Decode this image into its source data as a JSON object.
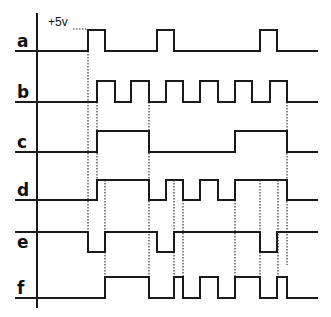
{
  "diagram": {
    "title": "",
    "voltage_label": "+5v",
    "axis": {
      "x": 37,
      "y_top": 13,
      "y_bottom": 308
    },
    "x_start": 15,
    "x_end": 318,
    "signals": [
      {
        "label": "a",
        "high_y": 30,
        "low_y": 51,
        "initial": "low",
        "edges": [
          88,
          105,
          157,
          174,
          260,
          277
        ]
      },
      {
        "label": "b",
        "high_y": 81,
        "low_y": 102,
        "initial": "low",
        "edges": [
          97,
          115,
          131,
          149,
          166,
          183,
          200,
          218,
          235,
          252,
          270,
          287
        ]
      },
      {
        "label": "c",
        "high_y": 131,
        "low_y": 152,
        "initial": "low",
        "edges": [
          97,
          149,
          235,
          287
        ]
      },
      {
        "label": "d",
        "high_y": 180,
        "low_y": 200,
        "initial": "low",
        "edges": [
          97,
          149,
          166,
          183,
          200,
          218,
          235,
          287
        ]
      },
      {
        "label": "e",
        "high_y": 232,
        "low_y": 252,
        "initial": "high",
        "edges": [
          88,
          105,
          157,
          174,
          260,
          277
        ]
      },
      {
        "label": "f",
        "high_y": 277,
        "low_y": 298,
        "initial": "low",
        "edges": [
          105,
          149,
          174,
          183,
          200,
          218,
          235,
          260,
          277,
          287
        ]
      }
    ],
    "dotted_guides": [
      {
        "x": 88,
        "y1": 30,
        "y2": 232
      },
      {
        "x": 97,
        "y1": 102,
        "y2": 200
      },
      {
        "x": 105,
        "y1": 180,
        "y2": 277
      },
      {
        "x": 149,
        "y1": 102,
        "y2": 277
      },
      {
        "x": 174,
        "y1": 180,
        "y2": 277
      },
      {
        "x": 183,
        "y1": 200,
        "y2": 277
      },
      {
        "x": 235,
        "y1": 200,
        "y2": 277
      },
      {
        "x": 260,
        "y1": 180,
        "y2": 277
      },
      {
        "x": 278,
        "y1": 180,
        "y2": 277
      },
      {
        "x": 287,
        "y1": 102,
        "y2": 265
      }
    ]
  }
}
